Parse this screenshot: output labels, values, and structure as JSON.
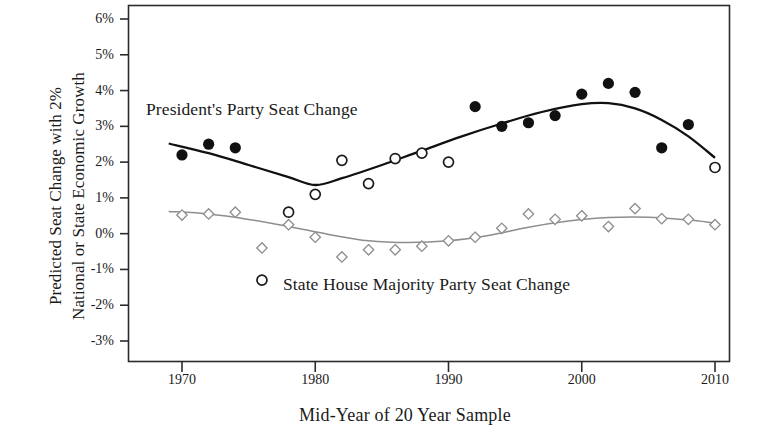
{
  "chart_data": {
    "type": "scatter",
    "title": "",
    "xlabel": "Mid-Year of 20 Year Sample",
    "ylabel": "Predicted Seat Change with 2% National or State Economic Growth",
    "ylabel_lines": [
      "Predicted Seat Change with 2%",
      "National or State Economic Growth"
    ],
    "xlim": [
      1967,
      2012
    ],
    "ylim": [
      -3,
      6
    ],
    "xticks": [
      1970,
      1980,
      1990,
      2000,
      2010
    ],
    "xticklabels": [
      "1970",
      "1980",
      "1990",
      "2000",
      "2010"
    ],
    "yticks": [
      -3,
      -2,
      -1,
      0,
      1,
      2,
      3,
      4,
      5,
      6
    ],
    "yticklabels": [
      "-3%",
      "-2%",
      "-1%",
      "0%",
      "1%",
      "2%",
      "3%",
      "4%",
      "5%",
      "6%"
    ],
    "grid": false,
    "legend_position": "in-plot annotations",
    "annotations": [
      {
        "text": "President's Party Seat Change",
        "x": 1970.5,
        "y": 3.55
      },
      {
        "text": "State House Majority Party Seat Change",
        "x": 1980.5,
        "y": -1.5
      }
    ],
    "series": [
      {
        "name": "President's Party Seat Change",
        "marker": "circle-filled-or-open",
        "color": "#111111",
        "points": [
          {
            "x": 1970,
            "y": 2.2,
            "filled": true
          },
          {
            "x": 1972,
            "y": 2.5,
            "filled": true
          },
          {
            "x": 1974,
            "y": 2.4,
            "filled": true
          },
          {
            "x": 1976,
            "y": -1.3,
            "filled": false
          },
          {
            "x": 1978,
            "y": 0.6,
            "filled": false
          },
          {
            "x": 1980,
            "y": 1.1,
            "filled": false
          },
          {
            "x": 1982,
            "y": 2.05,
            "filled": false
          },
          {
            "x": 1984,
            "y": 1.4,
            "filled": false
          },
          {
            "x": 1986,
            "y": 2.1,
            "filled": false
          },
          {
            "x": 1988,
            "y": 2.25,
            "filled": false
          },
          {
            "x": 1990,
            "y": 2.0,
            "filled": false
          },
          {
            "x": 1992,
            "y": 3.55,
            "filled": true
          },
          {
            "x": 1994,
            "y": 3.0,
            "filled": true
          },
          {
            "x": 1996,
            "y": 3.1,
            "filled": true
          },
          {
            "x": 1998,
            "y": 3.3,
            "filled": true
          },
          {
            "x": 2000,
            "y": 3.9,
            "filled": true
          },
          {
            "x": 2002,
            "y": 4.2,
            "filled": true
          },
          {
            "x": 2004,
            "y": 3.95,
            "filled": true
          },
          {
            "x": 2006,
            "y": 2.4,
            "filled": true
          },
          {
            "x": 2008,
            "y": 3.05,
            "filled": true
          },
          {
            "x": 2010,
            "y": 1.85,
            "filled": false
          }
        ],
        "trend": [
          {
            "x": 1969,
            "y": 2.52
          },
          {
            "x": 1972,
            "y": 2.25
          },
          {
            "x": 1975,
            "y": 1.92
          },
          {
            "x": 1978,
            "y": 1.58
          },
          {
            "x": 1980,
            "y": 1.36
          },
          {
            "x": 1982,
            "y": 1.55
          },
          {
            "x": 1985,
            "y": 1.92
          },
          {
            "x": 1988,
            "y": 2.32
          },
          {
            "x": 1991,
            "y": 2.72
          },
          {
            "x": 1994,
            "y": 3.08
          },
          {
            "x": 1997,
            "y": 3.4
          },
          {
            "x": 2000,
            "y": 3.62
          },
          {
            "x": 2002,
            "y": 3.65
          },
          {
            "x": 2004,
            "y": 3.5
          },
          {
            "x": 2006,
            "y": 3.18
          },
          {
            "x": 2008,
            "y": 2.72
          },
          {
            "x": 2010,
            "y": 2.12
          }
        ]
      },
      {
        "name": "State House Majority Party Seat Change",
        "marker": "diamond-open",
        "color": "#8d8d8d",
        "points": [
          {
            "x": 1970,
            "y": 0.52
          },
          {
            "x": 1972,
            "y": 0.55
          },
          {
            "x": 1974,
            "y": 0.6
          },
          {
            "x": 1976,
            "y": -0.4
          },
          {
            "x": 1978,
            "y": 0.25
          },
          {
            "x": 1980,
            "y": -0.1
          },
          {
            "x": 1982,
            "y": -0.65
          },
          {
            "x": 1984,
            "y": -0.45
          },
          {
            "x": 1986,
            "y": -0.45
          },
          {
            "x": 1988,
            "y": -0.35
          },
          {
            "x": 1990,
            "y": -0.2
          },
          {
            "x": 1992,
            "y": -0.1
          },
          {
            "x": 1994,
            "y": 0.15
          },
          {
            "x": 1996,
            "y": 0.55
          },
          {
            "x": 1998,
            "y": 0.4
          },
          {
            "x": 2000,
            "y": 0.5
          },
          {
            "x": 2002,
            "y": 0.2
          },
          {
            "x": 2004,
            "y": 0.7
          },
          {
            "x": 2006,
            "y": 0.42
          },
          {
            "x": 2008,
            "y": 0.4
          },
          {
            "x": 2010,
            "y": 0.25
          }
        ],
        "trend": [
          {
            "x": 1969,
            "y": 0.62
          },
          {
            "x": 1972,
            "y": 0.55
          },
          {
            "x": 1975,
            "y": 0.4
          },
          {
            "x": 1978,
            "y": 0.2
          },
          {
            "x": 1981,
            "y": -0.02
          },
          {
            "x": 1984,
            "y": -0.2
          },
          {
            "x": 1987,
            "y": -0.25
          },
          {
            "x": 1990,
            "y": -0.2
          },
          {
            "x": 1993,
            "y": -0.05
          },
          {
            "x": 1996,
            "y": 0.18
          },
          {
            "x": 1999,
            "y": 0.35
          },
          {
            "x": 2002,
            "y": 0.45
          },
          {
            "x": 2005,
            "y": 0.46
          },
          {
            "x": 2008,
            "y": 0.38
          },
          {
            "x": 2010,
            "y": 0.3
          }
        ]
      }
    ]
  }
}
